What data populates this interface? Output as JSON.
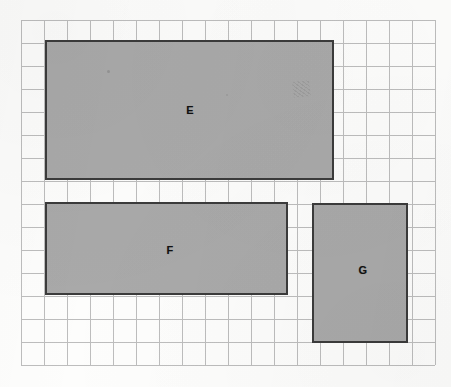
{
  "worksheet": {
    "title": "Grid with three shaded rectangles",
    "background_color": "#fdfdfc"
  },
  "grid": {
    "name": "square-grid",
    "columns": 18,
    "rows": 15,
    "cell_size_px": 23,
    "line_color": "#bdbdbd",
    "origin_x_px": 21,
    "origin_y_px": 20,
    "width_px": 414,
    "height_px": 345
  },
  "style": {
    "shape_fill": "#a9a9a9",
    "shape_border": "#3b3b3b",
    "label_color": "#111111"
  },
  "shapes": [
    {
      "id": "E",
      "label": "E",
      "x_px": 45,
      "y_px": 40,
      "width_px": 289,
      "height_px": 140,
      "grid_width_cells": 12.5,
      "grid_height_cells": 6,
      "label_x_px": 190,
      "label_y_px": 110
    },
    {
      "id": "F",
      "label": "F",
      "x_px": 45,
      "y_px": 202,
      "width_px": 243,
      "height_px": 93,
      "grid_width_cells": 10.5,
      "grid_height_cells": 4,
      "label_x_px": 170,
      "label_y_px": 250
    },
    {
      "id": "G",
      "label": "G",
      "x_px": 312,
      "y_px": 203,
      "width_px": 96,
      "height_px": 140,
      "grid_width_cells": 4,
      "grid_height_cells": 6,
      "label_x_px": 363,
      "label_y_px": 270
    }
  ],
  "chart_data": {
    "type": "diagram",
    "subtitle": "",
    "xlabel": "",
    "ylabel": "",
    "grid": true,
    "legend": "none",
    "unit": "grid square",
    "categories": [
      "E",
      "F",
      "G"
    ],
    "series": [
      {
        "name": "width (cells)",
        "values": [
          12.5,
          10.5,
          4
        ]
      },
      {
        "name": "height (cells)",
        "values": [
          6,
          4,
          6
        ]
      },
      {
        "name": "area (cells)",
        "values": [
          75,
          42,
          24
        ]
      },
      {
        "name": "perimeter (cells)",
        "values": [
          37,
          29,
          20
        ]
      }
    ],
    "annotations": [
      "E",
      "F",
      "G"
    ]
  }
}
